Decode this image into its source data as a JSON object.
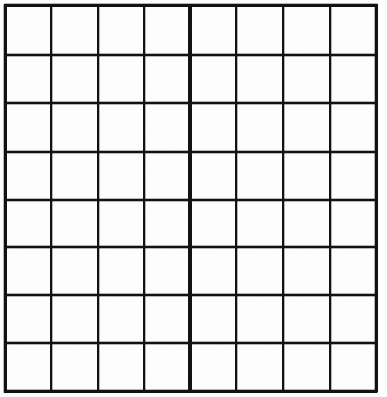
{
  "figure": {
    "kind": "grid",
    "rows": 8,
    "columns": 8,
    "cell_count": 64,
    "has_labels": false,
    "cell_text": "",
    "background_color": "#fdfdfd",
    "line_color": "#121212",
    "page_background": "#ffffff"
  },
  "geometry": {
    "width": 387,
    "height": 397,
    "grid_left": 5,
    "grid_top": 5,
    "grid_right": 376,
    "grid_bottom": 391,
    "vertical_line_x": [
      5,
      51,
      98,
      144,
      190,
      236,
      283,
      330,
      376
    ],
    "horizontal_line_y": [
      5,
      55,
      103,
      152,
      200,
      247,
      295,
      343,
      391
    ],
    "vertical_line_thickness": [
      3.0,
      2.0,
      2.0,
      2.0,
      3.6,
      2.0,
      2.0,
      2.0,
      3.0
    ],
    "horizontal_line_thickness": [
      3.0,
      2.4,
      2.6,
      2.4,
      2.4,
      2.4,
      2.4,
      2.4,
      3.0
    ],
    "emphasized_vertical_index": 4,
    "column_widths": [
      46,
      47,
      46,
      46,
      46,
      47,
      47,
      46
    ],
    "row_heights": [
      50,
      48,
      49,
      48,
      47,
      48,
      48,
      48
    ]
  },
  "cells": [
    [
      "",
      "",
      "",
      "",
      "",
      "",
      "",
      ""
    ],
    [
      "",
      "",
      "",
      "",
      "",
      "",
      "",
      ""
    ],
    [
      "",
      "",
      "",
      "",
      "",
      "",
      "",
      ""
    ],
    [
      "",
      "",
      "",
      "",
      "",
      "",
      "",
      ""
    ],
    [
      "",
      "",
      "",
      "",
      "",
      "",
      "",
      ""
    ],
    [
      "",
      "",
      "",
      "",
      "",
      "",
      "",
      ""
    ],
    [
      "",
      "",
      "",
      "",
      "",
      "",
      "",
      ""
    ],
    [
      "",
      "",
      "",
      "",
      "",
      "",
      "",
      ""
    ]
  ]
}
